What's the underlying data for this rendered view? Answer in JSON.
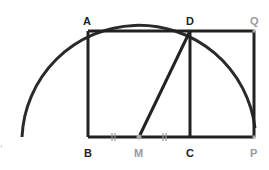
{
  "diagram": {
    "colors": {
      "line": "#222222",
      "point_gray": "#a8a8a8",
      "label_dark": "#222222",
      "label_gray": "#9a9a9a",
      "background": "#ffffff"
    },
    "points": {
      "A": {
        "label": "A",
        "x": 88,
        "y": 31
      },
      "D": {
        "label": "D",
        "x": 190,
        "y": 31
      },
      "Q": {
        "label": "Q",
        "x": 254,
        "y": 31
      },
      "B": {
        "label": "B",
        "x": 88,
        "y": 137
      },
      "M": {
        "label": "M",
        "x": 139,
        "y": 137
      },
      "C": {
        "label": "C",
        "x": 190,
        "y": 137
      },
      "P": {
        "label": "P",
        "x": 254,
        "y": 137
      }
    },
    "segments": [
      "AD",
      "DQ",
      "AB",
      "DC",
      "QP",
      "BM",
      "MC",
      "CP",
      "MD"
    ],
    "arc": {
      "center": "M",
      "radius": 117,
      "from": "left baseline",
      "to": "P"
    },
    "tick_marks": [
      "BM",
      "MC"
    ],
    "stray_mark": "."
  }
}
